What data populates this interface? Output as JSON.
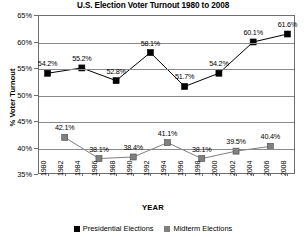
{
  "chart_data": {
    "type": "line",
    "title": "U.S. Election Voter Turnout 1980 to 2008",
    "xlabel": "YEAR",
    "ylabel": "% Voter Turnout",
    "ylim": [
      35,
      65
    ],
    "ytick_step": 5,
    "ytick_labels": [
      "65%",
      "60%",
      "55%",
      "50%",
      "45%",
      "40%",
      "35%"
    ],
    "grid": true,
    "legend_position": "bottom",
    "x": [
      1980,
      1982,
      1984,
      1986,
      1988,
      1990,
      1992,
      1994,
      1996,
      1998,
      2000,
      2002,
      2004,
      2006,
      2008
    ],
    "xtick_labels": [
      "1980",
      "1982",
      "1984",
      "1986",
      "1988",
      "1990",
      "1992",
      "1994",
      "1996",
      "1998",
      "2000",
      "2002",
      "2004",
      "2006",
      "2008"
    ],
    "series": [
      {
        "name": "Presidential Elections",
        "color": "#000000",
        "marker": "square",
        "points": [
          {
            "x": 1980,
            "y": 54.2,
            "label": "54.2%"
          },
          {
            "x": 1984,
            "y": 55.2,
            "label": "55.2%"
          },
          {
            "x": 1988,
            "y": 52.8,
            "label": "52.8%"
          },
          {
            "x": 1992,
            "y": 58.1,
            "label": "58.1%"
          },
          {
            "x": 1996,
            "y": 51.7,
            "label": "51.7%"
          },
          {
            "x": 2000,
            "y": 54.2,
            "label": "54.2%"
          },
          {
            "x": 2004,
            "y": 60.1,
            "label": "60.1%"
          },
          {
            "x": 2008,
            "y": 61.6,
            "label": "61.6%"
          }
        ]
      },
      {
        "name": "Midterm Elections",
        "color": "#808080",
        "marker": "square",
        "points": [
          {
            "x": 1982,
            "y": 42.1,
            "label": "42.1%"
          },
          {
            "x": 1986,
            "y": 38.1,
            "label": "38.1%"
          },
          {
            "x": 1990,
            "y": 38.4,
            "label": "38.4%"
          },
          {
            "x": 1994,
            "y": 41.1,
            "label": "41.1%"
          },
          {
            "x": 1998,
            "y": 38.1,
            "label": "38.1%"
          },
          {
            "x": 2002,
            "y": 39.5,
            "label": "39.5%"
          },
          {
            "x": 2006,
            "y": 40.4,
            "label": "40.4%"
          }
        ]
      }
    ]
  },
  "legend": {
    "items": [
      {
        "label": "Presidential Elections",
        "color": "#000000"
      },
      {
        "label": "Midterm Elections",
        "color": "#808080"
      }
    ]
  }
}
